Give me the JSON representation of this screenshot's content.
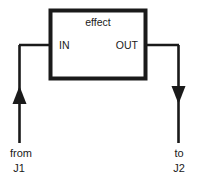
{
  "diagram": {
    "title": "effect",
    "type": "signal-flow-block-diagram",
    "colors": {
      "stroke": "#1a1a1a",
      "background": "#ffffff",
      "box_border": "#1a1a1a"
    },
    "block": {
      "label": "effect",
      "ports": {
        "input": "IN",
        "output": "OUT"
      }
    },
    "connections": [
      {
        "id": "input-connection",
        "label_line1": "from",
        "label_line2": "J1",
        "direction": "up",
        "arrow": "arrowhead-up"
      },
      {
        "id": "output-connection",
        "label_line1": "to",
        "label_line2": "J2",
        "direction": "down",
        "arrow": "arrowhead-down"
      }
    ]
  }
}
